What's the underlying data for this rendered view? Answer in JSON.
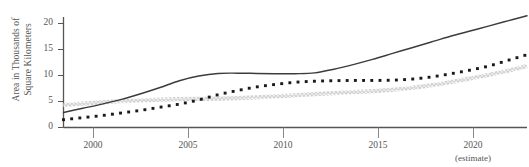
{
  "figure": {
    "background_color": "#ffffff",
    "axis_color": "#555555",
    "text_color": "#555555"
  },
  "axes": {
    "y_title_line1": "Area in Thousands of",
    "y_title_line2": "Square Kilometers",
    "y_ticks": [
      "0",
      "5",
      "10",
      "15",
      "20"
    ],
    "x_ticks": [
      "2000",
      "2005",
      "2010",
      "2015",
      "2020"
    ],
    "estimate_note": "(estimate)"
  },
  "chart_data": {
    "type": "line",
    "title": "",
    "xlabel": "",
    "ylabel": "Area in Thousands of Square Kilometers",
    "xlim": [
      1998,
      2022
    ],
    "ylim": [
      0,
      22
    ],
    "xticks": [
      2000,
      2005,
      2010,
      2015,
      2020
    ],
    "yticks": [
      0,
      5,
      10,
      15,
      20
    ],
    "grid": false,
    "legend": "none",
    "annotations": [
      {
        "text": "(estimate)",
        "x": 2020,
        "position": "below-axis"
      }
    ],
    "x": [
      1998,
      1999,
      2000,
      2001,
      2002,
      2003,
      2004,
      2005,
      2006,
      2007,
      2008,
      2009,
      2010,
      2011,
      2012,
      2013,
      2014,
      2015,
      2016,
      2017,
      2018,
      2019,
      2020,
      2021,
      2022
    ],
    "series": [
      {
        "name": "solid-line-series",
        "style": "solid",
        "color": "#3c3c3c",
        "values": [
          2.9,
          3.7,
          4.5,
          5.4,
          6.5,
          7.7,
          9.0,
          9.9,
          10.4,
          10.45,
          10.4,
          10.35,
          10.35,
          10.5,
          11.2,
          12.1,
          13.1,
          14.2,
          15.3,
          16.4,
          17.5,
          18.5,
          19.5,
          20.5,
          21.5
        ]
      },
      {
        "name": "dotted-line-series",
        "style": "dotted",
        "color": "#1a1a1a",
        "values": [
          1.5,
          1.9,
          2.3,
          2.8,
          3.3,
          3.9,
          4.5,
          5.3,
          6.3,
          7.1,
          7.8,
          8.3,
          8.7,
          8.9,
          9.0,
          9.05,
          9.05,
          9.1,
          9.3,
          9.7,
          10.3,
          11.0,
          11.8,
          12.9,
          14.0
        ]
      },
      {
        "name": "hatched-gray-series",
        "style": "crosshatch",
        "color": "#d0d0d0",
        "values": [
          4.3,
          4.6,
          4.85,
          5.05,
          5.2,
          5.35,
          5.45,
          5.5,
          5.55,
          5.65,
          5.8,
          6.0,
          6.2,
          6.4,
          6.6,
          6.8,
          7.0,
          7.25,
          7.6,
          8.1,
          8.7,
          9.4,
          10.1,
          10.9,
          11.8
        ]
      }
    ]
  }
}
